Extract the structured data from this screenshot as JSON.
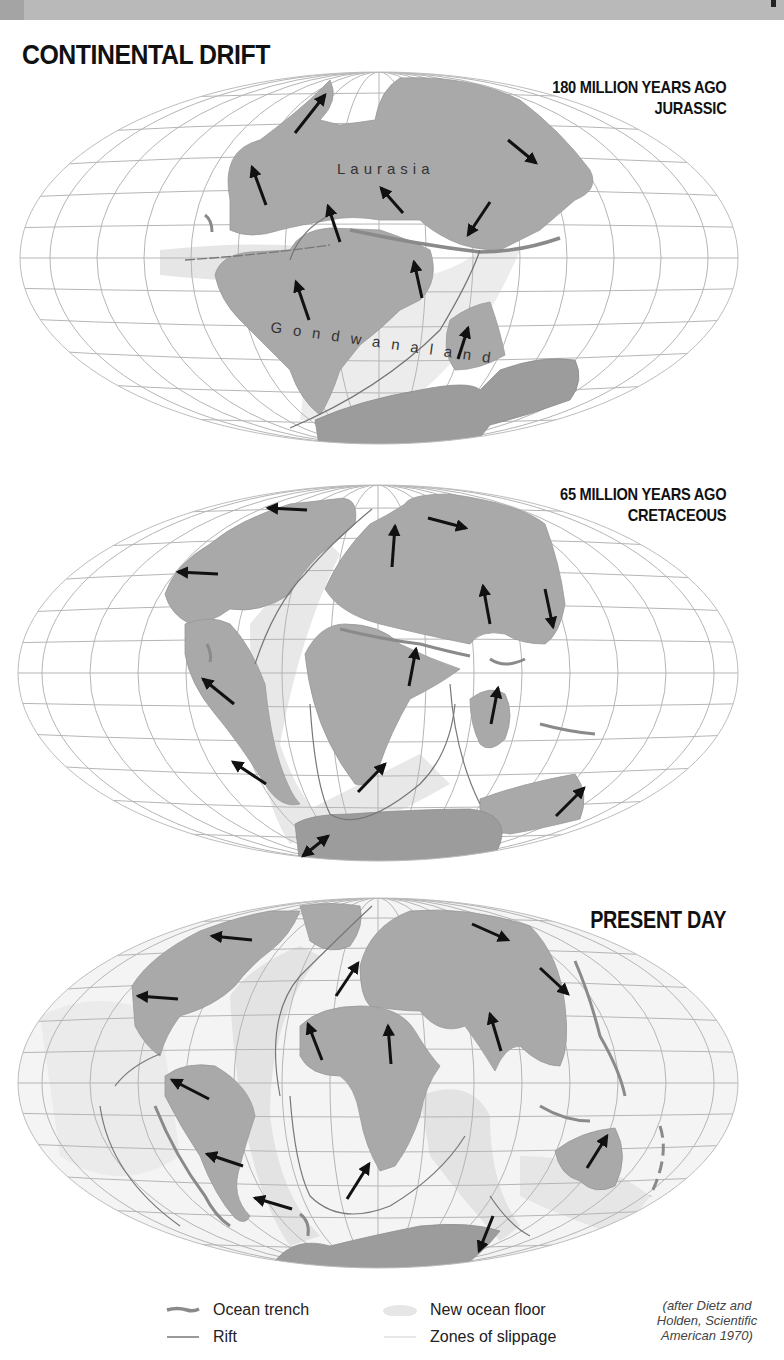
{
  "page": {
    "title": "CONTINENTAL DRIFT",
    "colors": {
      "land": "#a9a9a9",
      "land_dark": "#9a9a9a",
      "new_ocean_floor": "#e6e6e6",
      "grid": "#b5b5b5",
      "trench": "#8a8a8a",
      "rift": "#777777",
      "arrow": "#111111",
      "band": "#b9b9b9"
    }
  },
  "maps": [
    {
      "id": "jurassic",
      "label_line1": "180 MILLION YEARS AGO",
      "label_line2": "JURASSIC",
      "continent_labels": [
        "Laurasia",
        "Gondwanaland"
      ]
    },
    {
      "id": "cretaceous",
      "label_line1": "65 MILLION YEARS AGO",
      "label_line2": "CRETACEOUS"
    },
    {
      "id": "present",
      "label_line1": "PRESENT DAY"
    }
  ],
  "legend": {
    "items": [
      {
        "label": "Ocean trench",
        "symbol": "trench"
      },
      {
        "label": "Rift",
        "symbol": "rift"
      },
      {
        "label": "New ocean floor",
        "symbol": "new-ocean-floor"
      },
      {
        "label": "Zones of slippage",
        "symbol": "slippage"
      }
    ],
    "credit": "(after Dietz and Holden, Scientific American 1970)"
  }
}
